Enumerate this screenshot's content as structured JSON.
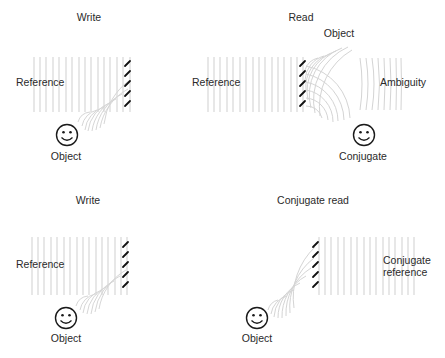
{
  "panels": [
    {
      "id": "write-top",
      "title": "Write",
      "labels": {
        "reference": "Reference",
        "object": "Object"
      }
    },
    {
      "id": "read",
      "title": "Read",
      "labels": {
        "reference": "Reference",
        "object": "Object",
        "ambiguity": "Ambiguity",
        "conjugate": "Conjugate"
      }
    },
    {
      "id": "write-bottom",
      "title": "Write",
      "labels": {
        "reference": "Reference",
        "object": "Object"
      }
    },
    {
      "id": "conjugate-read",
      "title": "Conjugate read",
      "labels": {
        "conjugate_reference_line1": "Conjugate",
        "conjugate_reference_line2": "reference",
        "object": "Object"
      }
    }
  ],
  "icons": {
    "object": "smiley-face-icon",
    "hologram": "fringe-pattern-icon"
  },
  "colors": {
    "wave_lines": "#c8c8c8",
    "fringes": "#1a1a1a",
    "text": "#2a2a2a"
  }
}
